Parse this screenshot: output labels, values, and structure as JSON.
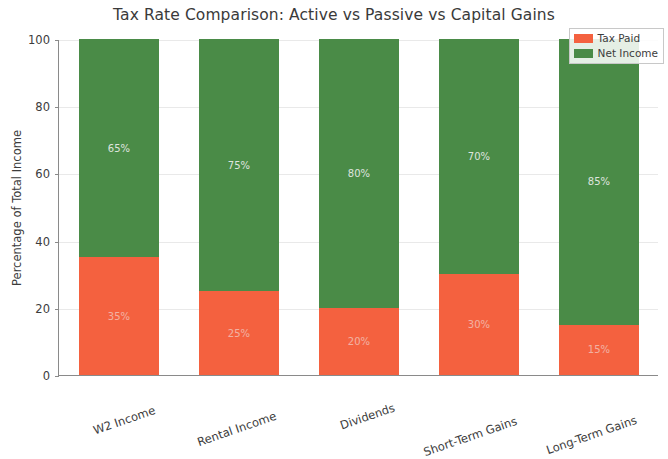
{
  "chart_data": {
    "type": "bar",
    "title": "Tax Rate Comparison: Active vs Passive vs Capital Gains",
    "xlabel": "",
    "ylabel": "Percentage of Total Income",
    "ylim": [
      0,
      100
    ],
    "yticks": [
      0,
      20,
      40,
      60,
      80,
      100
    ],
    "ytick_labels": [
      "0",
      "20",
      "40",
      "60",
      "80",
      "100"
    ],
    "grid": true,
    "stacked": true,
    "legend_position": "upper right",
    "categories": [
      "W2 Income",
      "Rental Income",
      "Dividends",
      "Short-Term Gains",
      "Long-Term Gains"
    ],
    "series": [
      {
        "name": "Tax Paid",
        "color": "#f4613f",
        "values": [
          35,
          25,
          20,
          30,
          15
        ],
        "data_labels": [
          "35%",
          "25%",
          "20%",
          "30%",
          "15%"
        ]
      },
      {
        "name": "Net Income",
        "color": "#4a8b47",
        "values": [
          65,
          75,
          80,
          70,
          85
        ],
        "data_labels": [
          "65%",
          "75%",
          "80%",
          "70%",
          "85%"
        ]
      }
    ]
  }
}
